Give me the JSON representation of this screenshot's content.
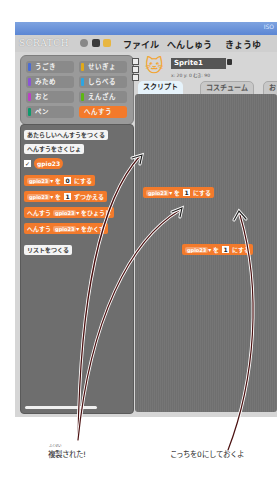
{
  "window": {
    "title_right": "ISO"
  },
  "menubar": {
    "logo": "SCRATCH",
    "menus": [
      "ファイル",
      "へんしゅう",
      "きょうゆ"
    ]
  },
  "categories": [
    {
      "label": "うごき",
      "color": "#4a6cd4"
    },
    {
      "label": "せいぎょ",
      "color": "#e1a91a"
    },
    {
      "label": "みため",
      "color": "#8a55d7"
    },
    {
      "label": "しらべる",
      "color": "#2ca5e2"
    },
    {
      "label": "おと",
      "color": "#bb42c3"
    },
    {
      "label": "えんざん",
      "color": "#5cb712"
    },
    {
      "label": "ペン",
      "color": "#0e9a6c"
    },
    {
      "label": "へんすう",
      "color": "#ee7d16",
      "selected": true
    }
  ],
  "palette": {
    "new_variable_button": "あたらしいへんすうをつくる",
    "delete_variable_button": "へんすうをさくじょ",
    "variable_name": "gpio23",
    "variable_checked": true,
    "blocks": [
      {
        "var": "gpio23",
        "mid": "を",
        "num": "0",
        "tail": "にする"
      },
      {
        "var": "gpio23",
        "mid": "を",
        "num": "1",
        "tail": "ずつかえる"
      },
      {
        "pre": "へんすう",
        "var": "gpio23",
        "tail": "をひょうじ"
      },
      {
        "pre": "へんすう",
        "var": "gpio23",
        "tail": "をかくす"
      }
    ],
    "new_list_button": "リストをつくる"
  },
  "sprite": {
    "name": "Sprite1",
    "coords": "x: 20  y: 0  むき: 90",
    "tabs": [
      "スクリプト",
      "コスチューム",
      "おと"
    ],
    "active_tab": "スクリプト"
  },
  "scripts": [
    {
      "var": "gpio23",
      "mid": "を",
      "num": "1",
      "tail": "にする"
    },
    {
      "var": "gpio23",
      "mid": "を",
      "num": "1",
      "tail": "にする"
    }
  ],
  "annotations": {
    "left_ruby": "ふくせい",
    "left_caption": "複製された!",
    "right_caption": "こっちを0にしておくよ"
  }
}
